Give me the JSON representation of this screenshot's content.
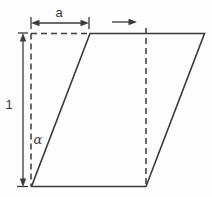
{
  "diagram": {
    "type": "shear-transformation-diagram",
    "labels": {
      "shear_offset": "a",
      "unit_height": "1",
      "shear_angle": "α"
    },
    "colors": {
      "line": "#3a3a3a",
      "background": "#fdfdfd"
    }
  }
}
